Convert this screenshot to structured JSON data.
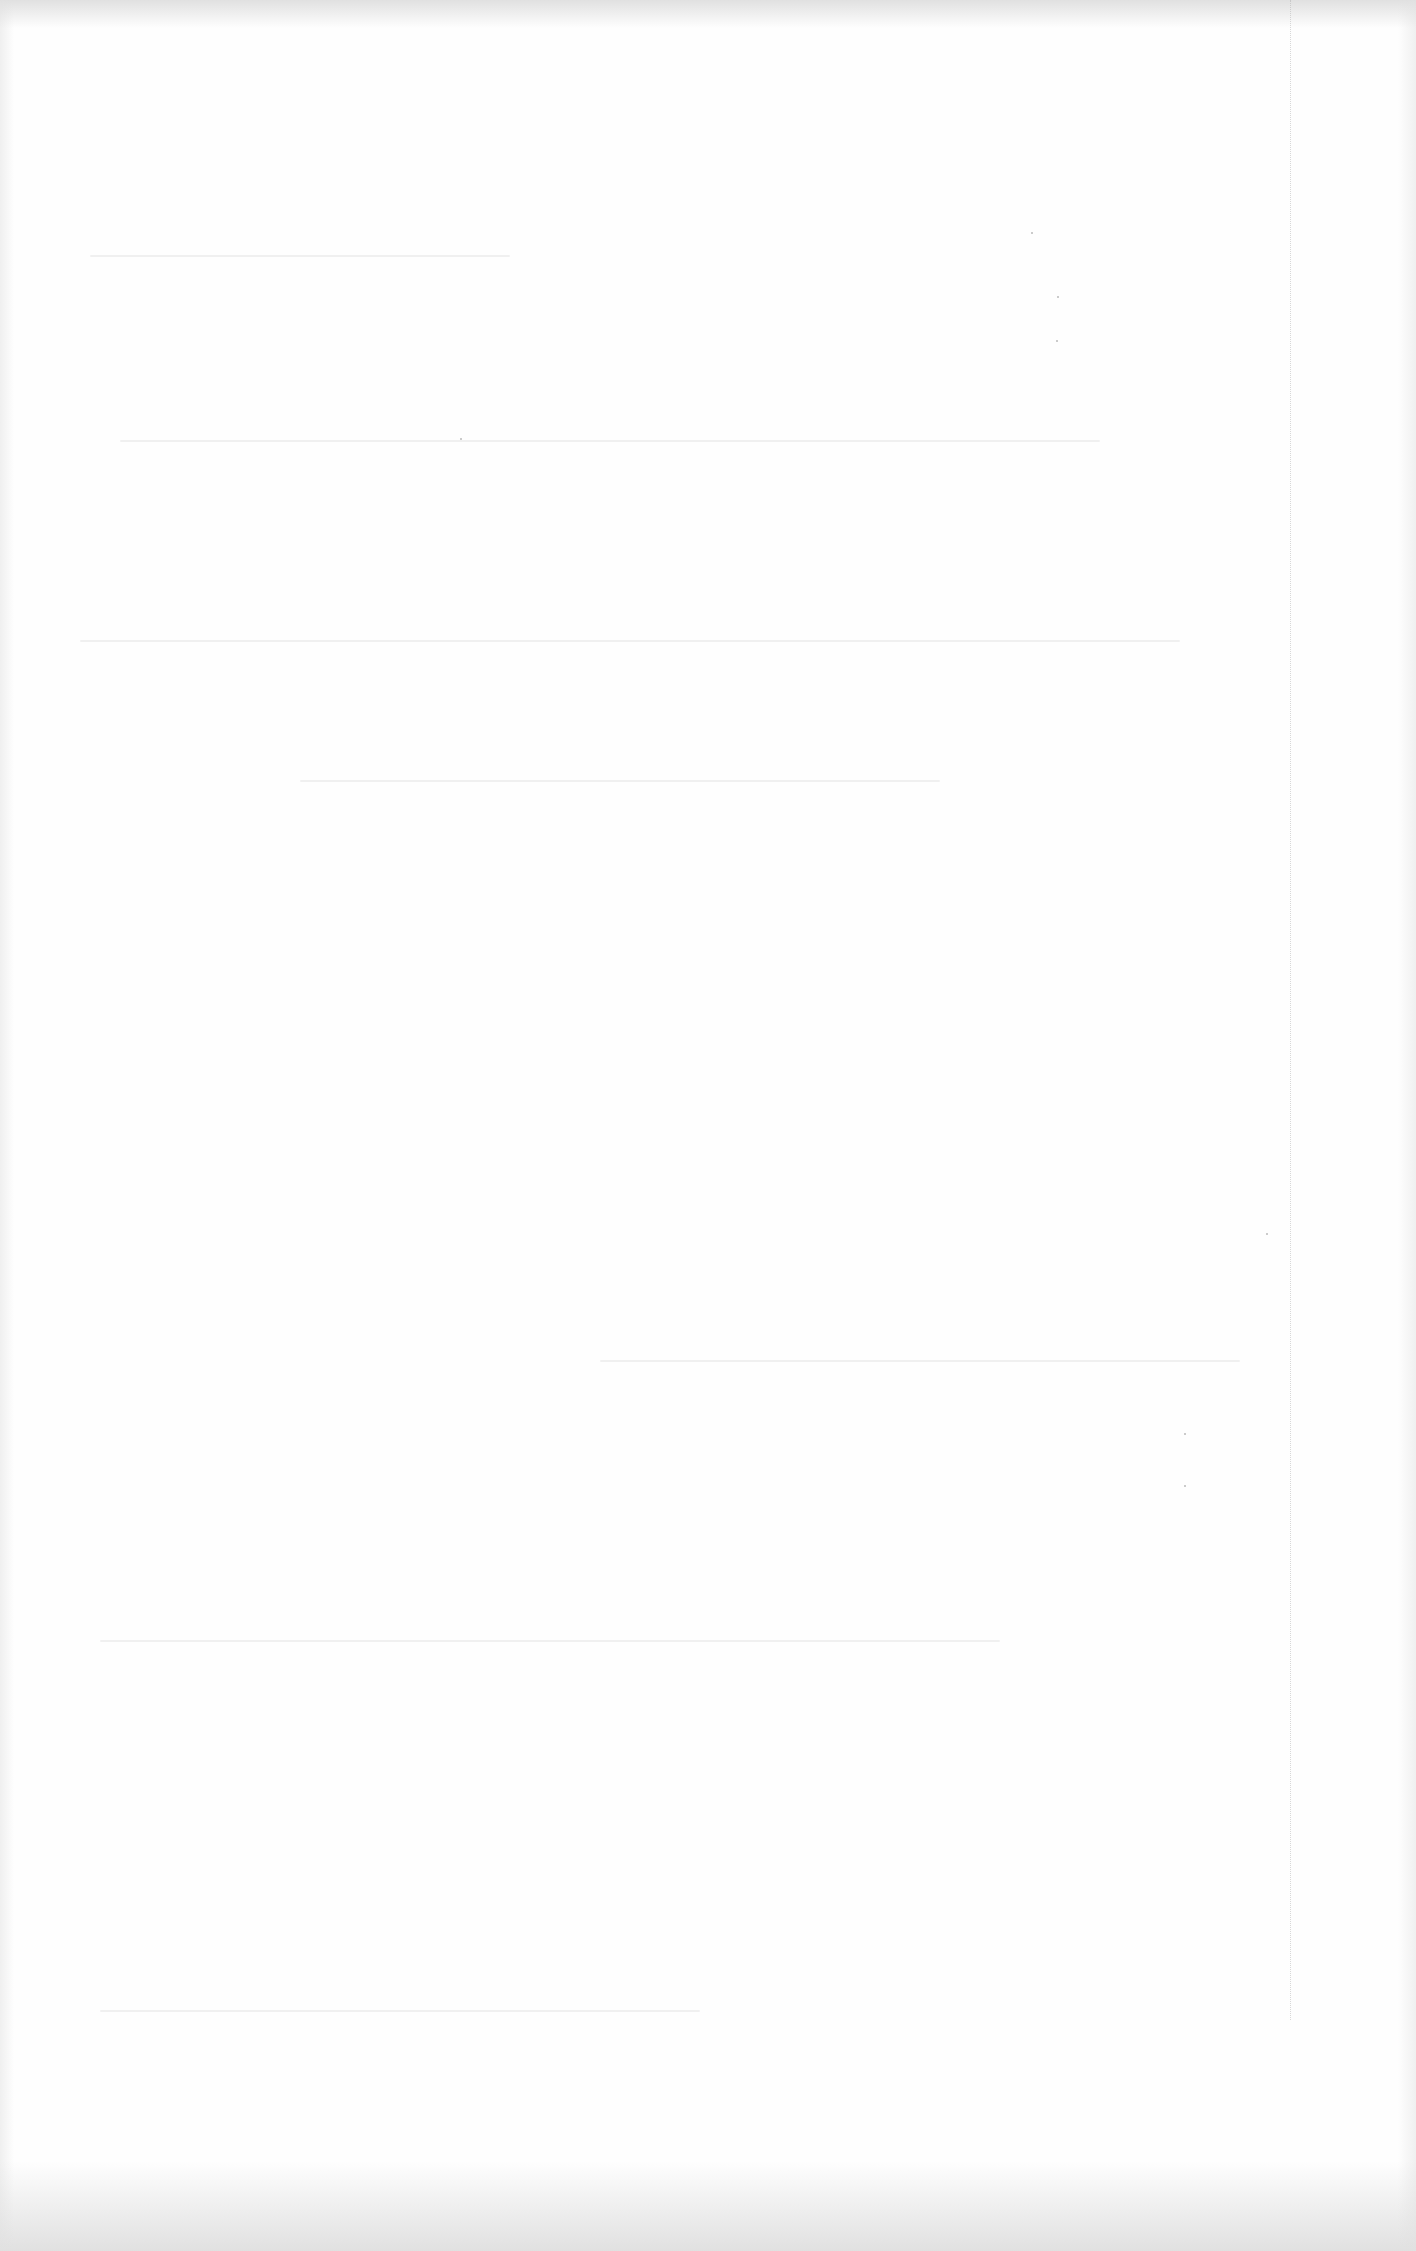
{
  "document": {
    "type": "scanned-page",
    "text_blocks": [],
    "background_color": "#fefefe",
    "note_visible_content": ""
  }
}
